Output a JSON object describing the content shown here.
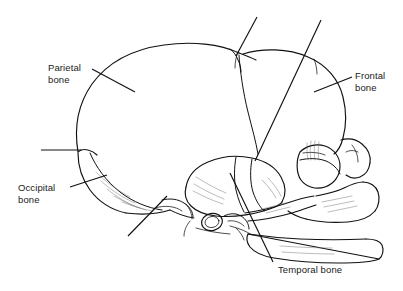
{
  "figure": {
    "type": "anatomical-line-drawing",
    "background_color": "#ffffff",
    "line_color": "#111111"
  },
  "labels": {
    "parietal": "Parietal\nbone",
    "frontal": "Frontal\nbone",
    "occipital": "Occipital\nbone",
    "temporal": "Temporal bone"
  },
  "leader_lines": {
    "parietal": "leader-line-parietal",
    "frontal": "leader-line-frontal",
    "occipital": "leader-line-occipital",
    "temporal": "leader-line-temporal",
    "unlabeled_top": "leader-line-anterior-fontanelle",
    "unlabeled_long": "leader-line-coronal-suture",
    "unlabeled_left": "leader-line-lambdoid-suture",
    "unlabeled_lower": "leader-line-mastoid"
  },
  "structures": {
    "cranial_vault": "cranial-vault-outline",
    "parietal_bone": "parietal-bone-region",
    "frontal_bone": "frontal-bone-region",
    "occipital_bone": "occipital-bone-region",
    "temporal_bone": "temporal-bone-region",
    "orbit": "orbital-rim",
    "maxilla": "maxilla-outline",
    "mandible": "mandible-outline",
    "auditory_meatus": "external-auditory-meatus",
    "coronal_suture": "coronal-suture-line",
    "lambdoid_suture": "lambdoid-suture-line",
    "anterior_fontanelle": "anterior-fontanelle"
  }
}
